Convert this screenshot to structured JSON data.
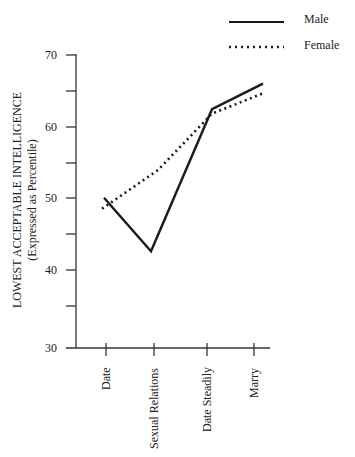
{
  "chart_data": {
    "type": "line",
    "title": "",
    "xlabel": "",
    "ylabel": "LOWEST ACCEPTABLE INTELLIGENCE",
    "ylabel_sub": "(Expressed as Percentile)",
    "categories": [
      "Date",
      "Sexual Relations",
      "Date Steadily",
      "Marry"
    ],
    "series": [
      {
        "name": "Male",
        "style": "solid",
        "values": [
          50.5,
          43.2,
          62.6,
          66.1
        ]
      },
      {
        "name": "Female",
        "style": "dotted",
        "values": [
          49.0,
          54.3,
          62.0,
          64.7
        ]
      }
    ],
    "ylim": [
      30,
      70
    ],
    "yticks": [
      30,
      35,
      40,
      45,
      50,
      55,
      60,
      65,
      70
    ],
    "ytick_labels": [
      "30",
      "40",
      "50",
      "60",
      "70"
    ],
    "grid": false,
    "legend_position": "top-right",
    "colors": {
      "line": "#1a1a1a",
      "axis": "#333333"
    }
  },
  "legend": {
    "male_label": "Male",
    "female_label": "Female"
  },
  "axis": {
    "y_title": "LOWEST ACCEPTABLE INTELLIGENCE",
    "y_subtitle": "(Expressed as Percentile)",
    "y_labels": {
      "t30": "30",
      "t40": "40",
      "t50": "50",
      "t60": "60",
      "t70": "70"
    },
    "x_labels": {
      "c0": "Date",
      "c1": "Sexual Relations",
      "c2": "Date Steadily",
      "c3": "Marry"
    }
  }
}
